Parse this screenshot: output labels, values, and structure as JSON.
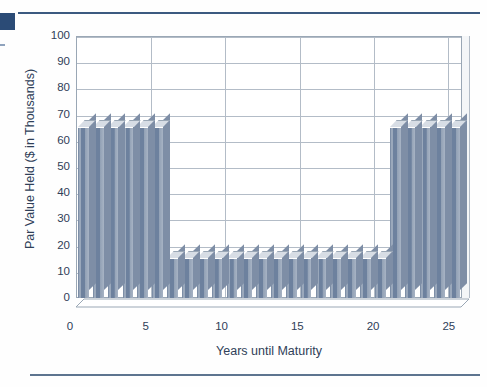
{
  "page": {
    "decor": {
      "top_rule_color": "#3c5a80",
      "corner_block_color": "#2b4b76",
      "bottom_rule_color": "#5d748f"
    }
  },
  "chart_data": {
    "type": "bar",
    "title": "",
    "subtitle": "",
    "xlabel": "Years until Maturity",
    "ylabel": "Par Value Held ($ in Thousands)",
    "xlim": [
      0,
      26
    ],
    "ylim": [
      0,
      100
    ],
    "yticks": [
      0,
      10,
      20,
      30,
      40,
      50,
      60,
      70,
      80,
      90,
      100
    ],
    "ytick_labels": [
      "0",
      "10",
      "20",
      "30",
      "40",
      "50",
      "60",
      "70",
      "80",
      "90",
      "100"
    ],
    "xticks": [
      0,
      5,
      10,
      15,
      20,
      25
    ],
    "xtick_labels": [
      "0",
      "5",
      "10",
      "15",
      "20",
      "25"
    ],
    "grid": "horizontal-and-vertical",
    "legend": "none",
    "bar_style": "3d-column",
    "bar_color": "#7d8ea6",
    "categories": [
      1,
      2,
      3,
      4,
      5,
      6,
      7,
      8,
      9,
      10,
      11,
      12,
      13,
      14,
      15,
      16,
      17,
      18,
      19,
      20,
      21,
      22,
      23,
      24,
      25,
      26
    ],
    "values": [
      65,
      65,
      65,
      65,
      65,
      65,
      15,
      15,
      15,
      15,
      15,
      15,
      15,
      15,
      15,
      15,
      15,
      15,
      15,
      15,
      15,
      65,
      65,
      65,
      65,
      65
    ],
    "series": [
      {
        "name": "Par Value Held",
        "values": [
          65,
          65,
          65,
          65,
          65,
          65,
          15,
          15,
          15,
          15,
          15,
          15,
          15,
          15,
          15,
          15,
          15,
          15,
          15,
          15,
          15,
          65,
          65,
          65,
          65,
          65
        ]
      }
    ],
    "annotations": []
  }
}
